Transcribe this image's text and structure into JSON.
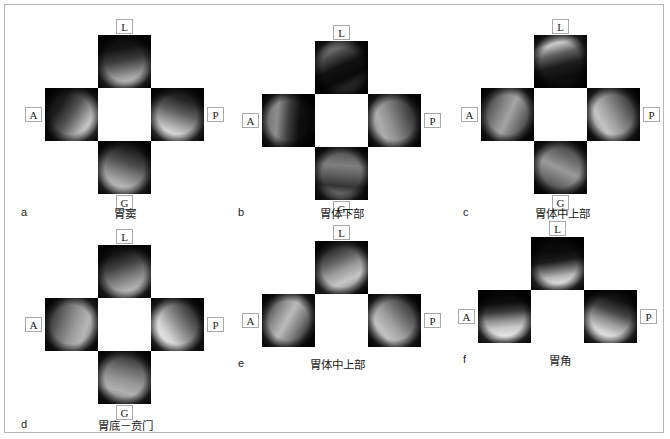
{
  "figure": {
    "background_color": "#ffffff",
    "frame_border_color": "#b5b5b5",
    "label_box_border_color": "#a9a9a9",
    "text_color": "#1c1c1c"
  },
  "direction_labels": {
    "lesser_curvature": "L",
    "anterior": "A",
    "posterior": "P",
    "greater_curvature": "G"
  },
  "panels": [
    {
      "letter": "a",
      "caption": "胃窦",
      "layout": "cross-4",
      "labels": {
        "top": "L",
        "left": "A",
        "right": "P",
        "bottom": "G"
      }
    },
    {
      "letter": "b",
      "caption": "胃体下部",
      "layout": "cross-4",
      "labels": {
        "top": "L",
        "left": "A",
        "right": "P",
        "bottom": "G"
      }
    },
    {
      "letter": "c",
      "caption": "胃体中上部",
      "layout": "cross-4",
      "labels": {
        "top": "L",
        "left": "A",
        "right": "P",
        "bottom": "G"
      }
    },
    {
      "letter": "d",
      "caption": "胃底－贲门",
      "layout": "cross-4",
      "labels": {
        "top": "L",
        "left": "A",
        "right": "P",
        "bottom": "G"
      }
    },
    {
      "letter": "e",
      "caption": "胃体中上部",
      "layout": "cross-3",
      "labels": {
        "top": "L",
        "left": "A",
        "right": "P",
        "bottom": ""
      }
    },
    {
      "letter": "f",
      "caption": "胃角",
      "layout": "cross-3",
      "labels": {
        "top": "L",
        "left": "A",
        "right": "P",
        "bottom": ""
      }
    }
  ]
}
